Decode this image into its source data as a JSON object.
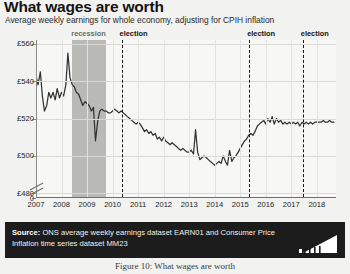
{
  "title": "What wages are worth",
  "subtitle": "Average weekly earnings for whole economy, adjusting for CPIH inflation",
  "source": {
    "label": "Source:",
    "text": " ONS average weekly earnings dataset EARN01 and Consumer Price Inflation time series dataset MM23",
    "logo_name": "ons-bar-logo"
  },
  "caption": "Figure 10: What wages are worth",
  "colors": {
    "line": "#333333",
    "recession_band": "#b9b9b6",
    "election_line": "#161616",
    "plot_background": "#f7f7f5",
    "page_background": "#f2f2f0",
    "source_bar": "#1c1c1c"
  },
  "annotations": [
    {
      "name": "recession",
      "label": "recession",
      "start_year": 2008.42,
      "end_year": 2009.75,
      "style": "band"
    },
    {
      "name": "election-2010",
      "label": "election",
      "year": 2010.35,
      "style": "dashed-line"
    },
    {
      "name": "election-2015",
      "label": "election",
      "year": 2015.35,
      "style": "dashed-line"
    },
    {
      "name": "election-2017",
      "label": "election",
      "year": 2017.45,
      "style": "dashed-line"
    }
  ],
  "chart_data": {
    "type": "line",
    "title": "What wages are worth",
    "subtitle": "Average weekly earnings for whole economy, adjusting for CPIH inflation",
    "xlabel": "",
    "ylabel": "",
    "grid": true,
    "legend": "none",
    "axis_break": true,
    "xlim": [
      2007.0,
      2018.75
    ],
    "ylim": [
      478,
      562
    ],
    "xticks": [
      "2007",
      "2008",
      "2009",
      "2010",
      "2011",
      "2012",
      "2013",
      "2014",
      "2015",
      "2016",
      "2017",
      "2018"
    ],
    "yticks": [
      "£560",
      "£540",
      "£520",
      "£500",
      "£480",
      "0"
    ],
    "ytick_values": [
      560,
      540,
      520,
      500,
      480,
      0
    ],
    "units": "GBP per week (real terms)",
    "series": [
      {
        "name": "Average weekly earnings (real, CPIH-adjusted)",
        "x": [
          2007.0,
          2007.08,
          2007.17,
          2007.25,
          2007.33,
          2007.42,
          2007.5,
          2007.58,
          2007.67,
          2007.75,
          2007.83,
          2007.92,
          2008.0,
          2008.08,
          2008.17,
          2008.25,
          2008.33,
          2008.42,
          2008.5,
          2008.58,
          2008.67,
          2008.75,
          2008.83,
          2008.92,
          2009.0,
          2009.08,
          2009.17,
          2009.25,
          2009.33,
          2009.42,
          2009.5,
          2009.58,
          2009.67,
          2009.75,
          2009.83,
          2009.92,
          2010.0,
          2010.08,
          2010.17,
          2010.25,
          2010.33,
          2010.42,
          2010.5,
          2010.58,
          2010.67,
          2010.75,
          2010.83,
          2010.92,
          2011.0,
          2011.08,
          2011.17,
          2011.25,
          2011.33,
          2011.42,
          2011.5,
          2011.58,
          2011.67,
          2011.75,
          2011.83,
          2011.92,
          2012.0,
          2012.08,
          2012.17,
          2012.25,
          2012.33,
          2012.42,
          2012.5,
          2012.58,
          2012.67,
          2012.75,
          2012.83,
          2012.92,
          2013.0,
          2013.08,
          2013.17,
          2013.25,
          2013.33,
          2013.42,
          2013.5,
          2013.58,
          2013.67,
          2013.75,
          2013.83,
          2013.92,
          2014.0,
          2014.08,
          2014.17,
          2014.25,
          2014.33,
          2014.42,
          2014.5,
          2014.58,
          2014.67,
          2014.75,
          2014.83,
          2014.92,
          2015.0,
          2015.08,
          2015.17,
          2015.25,
          2015.33,
          2015.42,
          2015.5,
          2015.58,
          2015.67,
          2015.75,
          2015.83,
          2015.92,
          2016.0,
          2016.08,
          2016.17,
          2016.25,
          2016.33,
          2016.42,
          2016.5,
          2016.58,
          2016.67,
          2016.75,
          2016.83,
          2016.92,
          2017.0,
          2017.08,
          2017.17,
          2017.25,
          2017.33,
          2017.42,
          2017.5,
          2017.58,
          2017.67,
          2017.75,
          2017.83,
          2017.92,
          2018.0,
          2018.08,
          2018.17,
          2018.25,
          2018.33,
          2018.42,
          2018.5,
          2018.58,
          2018.67
        ],
        "values": [
          543,
          538,
          545,
          532,
          524,
          527,
          534,
          531,
          534,
          530,
          536,
          531,
          534,
          532,
          538,
          555,
          542,
          538,
          537,
          534,
          533,
          530,
          527,
          529,
          528,
          527,
          524,
          526,
          508,
          519,
          524,
          525,
          524,
          524,
          523,
          523,
          524,
          525,
          524,
          523,
          524,
          523,
          522,
          521,
          520,
          519,
          518,
          517,
          518,
          517,
          515,
          513,
          514,
          512,
          513,
          511,
          512,
          509,
          510,
          508,
          510,
          508,
          507,
          506,
          507,
          506,
          505,
          504,
          503,
          504,
          503,
          502,
          502,
          503,
          501,
          514,
          502,
          498,
          499,
          500,
          499,
          498,
          497,
          496,
          495,
          496,
          497,
          496,
          500,
          497,
          495,
          503,
          497,
          499,
          500,
          502,
          504,
          506,
          508,
          509,
          511,
          512,
          511,
          513,
          516,
          517,
          518,
          519,
          517,
          520,
          518,
          521,
          517,
          520,
          518,
          519,
          517,
          518,
          517,
          518,
          517,
          518,
          517,
          518,
          516,
          518,
          517,
          518,
          517,
          518,
          517,
          518,
          518,
          518,
          518,
          519,
          518,
          518,
          519,
          518,
          518
        ]
      }
    ]
  }
}
